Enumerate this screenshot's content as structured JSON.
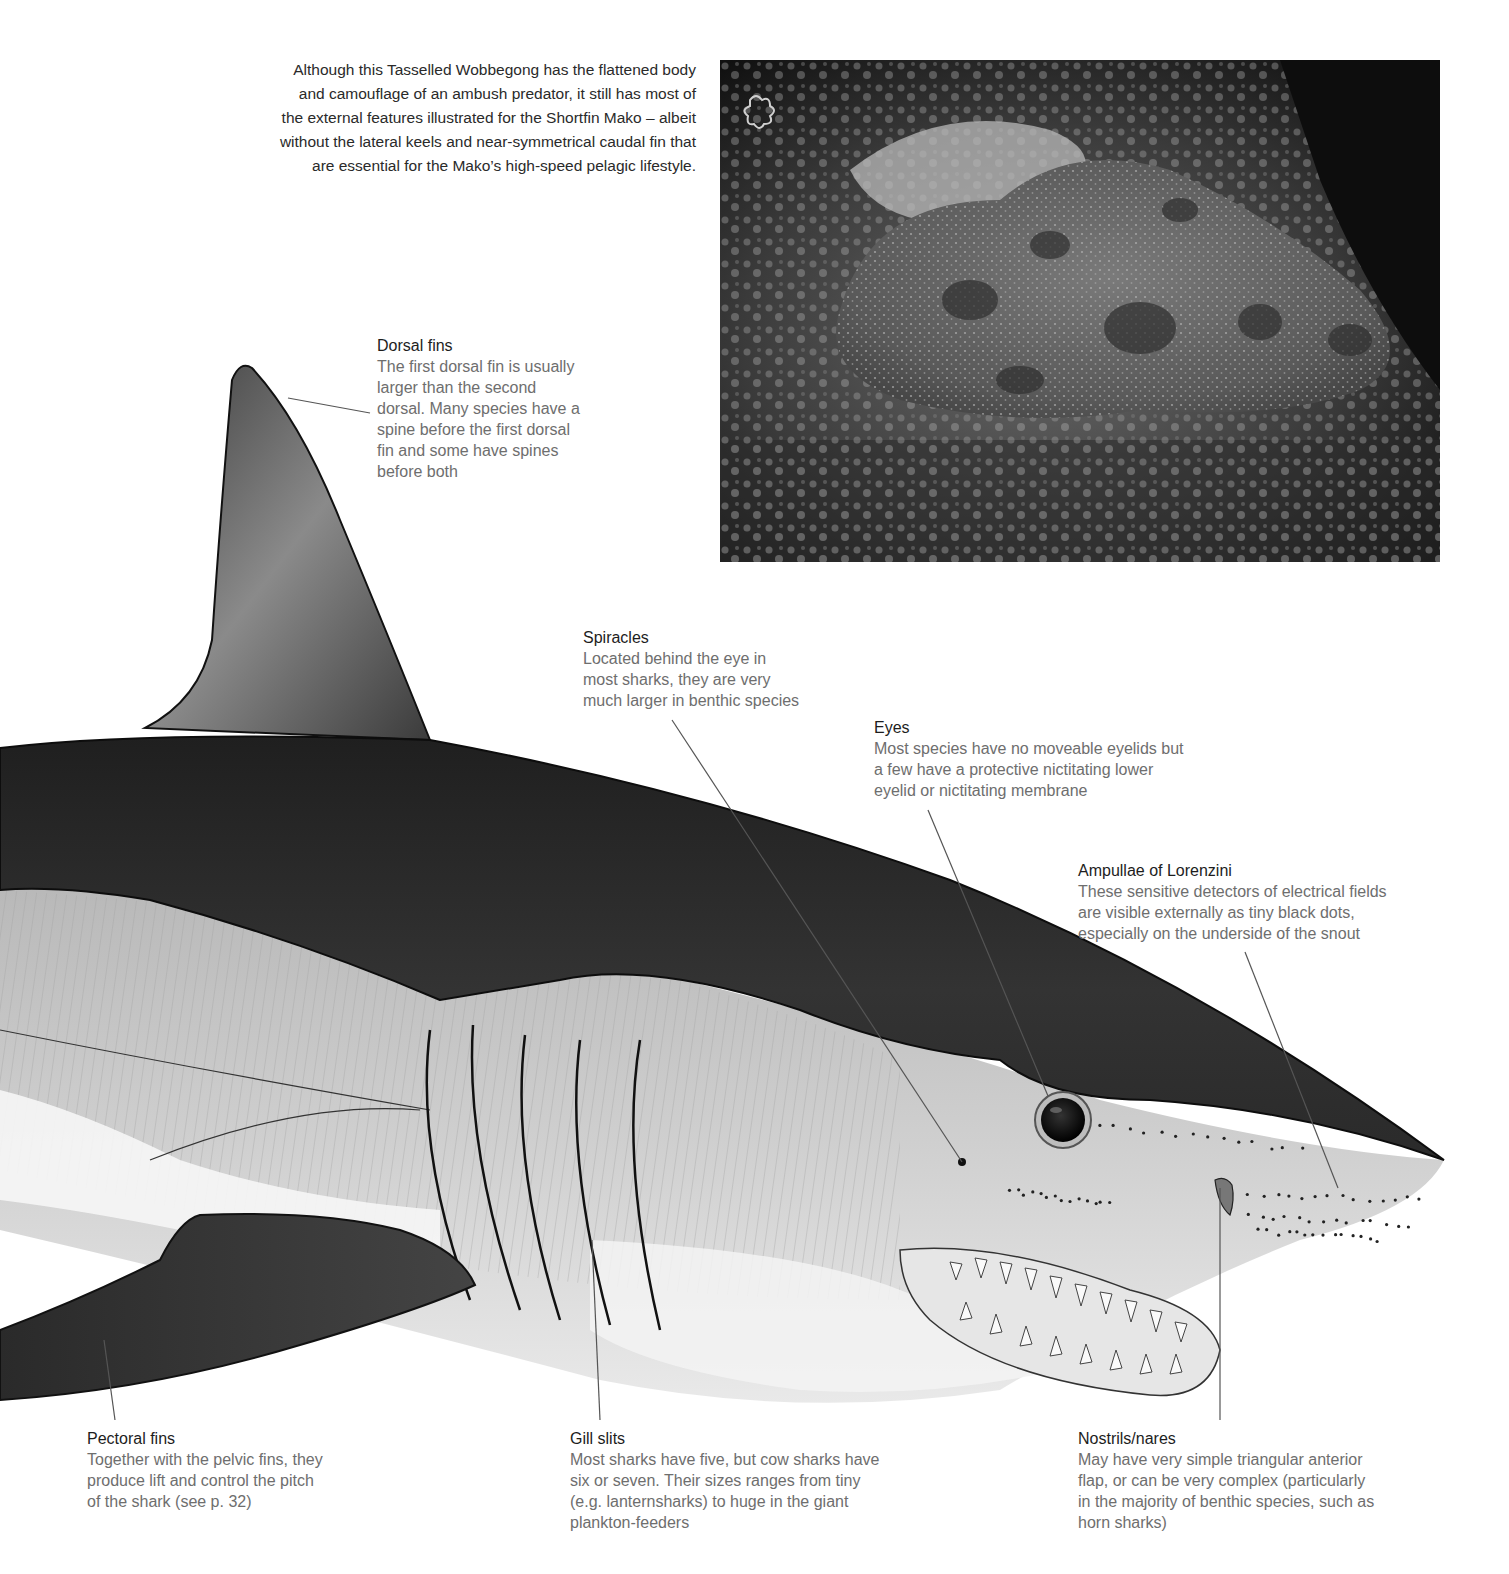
{
  "caption": "Although this Tasselled Wobbegong has the flattened body and camouflage of an ambush predator, it still has most of the external features illustrated for the Shortfin Mako – albeit without the lateral keels and near-symmetrical caudal fin that are essential for the Mako’s high-speed pelagic lifestyle.",
  "caption_lines": [
    "Although this Tasselled Wobbegong has the flattened body",
    "and camouflage of an ambush predator, it still has most of",
    "the external features illustrated for the Shortfin Mako – albeit",
    "without the lateral keels and near-symmetrical caudal fin that",
    "are essential for the Mako’s high-speed pelagic lifestyle."
  ],
  "photo": {
    "subject": "Tasselled Wobbegong on reef"
  },
  "illustration": {
    "subject": "Shortfin Mako head, side view"
  },
  "labels": {
    "dorsal": {
      "title": "Dorsal fins",
      "lines": [
        "The first dorsal fin is usually",
        "larger than the second",
        "dorsal. Many species have a",
        "spine before the first dorsal",
        "fin and some have spines",
        "before both"
      ]
    },
    "spiracles": {
      "title": "Spiracles",
      "lines": [
        "Located behind the eye in",
        "most sharks, they are very",
        "much larger in benthic species"
      ]
    },
    "eyes": {
      "title": "Eyes",
      "lines": [
        "Most species have no moveable eyelids but",
        "a few have a protective nictitating lower",
        "eyelid or nictitating membrane"
      ]
    },
    "ampullae": {
      "title": "Ampullae of Lorenzini",
      "lines": [
        "These sensitive detectors of electrical fields",
        "are visible externally as tiny black dots,",
        "especially on the underside of the snout"
      ]
    },
    "pectoral": {
      "title": "Pectoral fins",
      "lines": [
        "Together with the pelvic fins, they",
        "produce lift and control the pitch",
        "of the shark (see p. 32)"
      ]
    },
    "gills": {
      "title": "Gill slits",
      "lines": [
        "Most sharks have five, but cow sharks have",
        "six or seven. Their sizes ranges from tiny",
        "(e.g. lanternsharks) to huge in the giant",
        "plankton-feeders"
      ]
    },
    "nostrils": {
      "title": "Nostrils/nares",
      "lines": [
        "May have very simple triangular anterior",
        "flap, or can be very complex (particularly",
        "in the majority of benthic species, such as",
        "horn sharks)"
      ]
    }
  }
}
